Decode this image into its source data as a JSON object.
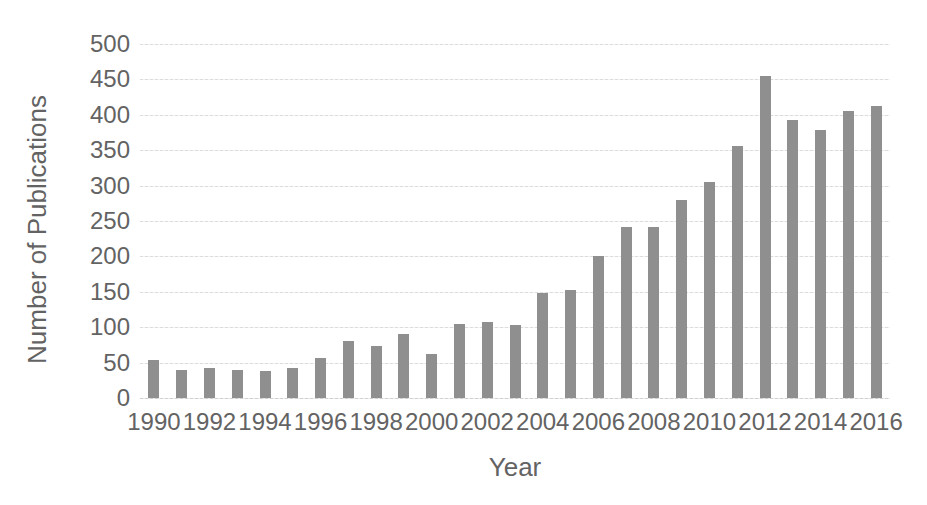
{
  "chart_data": {
    "type": "bar",
    "title": "",
    "xlabel": "Year",
    "ylabel": "Number of Publications",
    "categories": [
      1990,
      1991,
      1992,
      1993,
      1994,
      1995,
      1996,
      1997,
      1998,
      1999,
      2000,
      2001,
      2002,
      2003,
      2004,
      2005,
      2006,
      2007,
      2008,
      2009,
      2010,
      2011,
      2012,
      2013,
      2014,
      2015,
      2016
    ],
    "values": [
      53,
      39,
      43,
      39,
      38,
      42,
      57,
      81,
      74,
      91,
      62,
      104,
      108,
      103,
      149,
      153,
      201,
      241,
      241,
      279,
      305,
      356,
      455,
      393,
      378,
      405,
      413
    ],
    "x_tick_labels": [
      "1990",
      "1992",
      "1994",
      "1996",
      "1998",
      "2000",
      "2002",
      "2004",
      "2006",
      "2008",
      "2010",
      "2012",
      "2014",
      "2016"
    ],
    "y_tick_labels": [
      "500",
      "450",
      "400",
      "350",
      "300",
      "250",
      "200",
      "150",
      "100",
      "50",
      "0"
    ],
    "ylim": [
      0,
      500
    ],
    "y_tick_step": 50,
    "grid": "horizontal",
    "legend": "none",
    "bar_color": "#8f8f8f",
    "gridline_color": "#dcdcdc",
    "text_color": "#636363",
    "background_color": "#ffffff"
  }
}
